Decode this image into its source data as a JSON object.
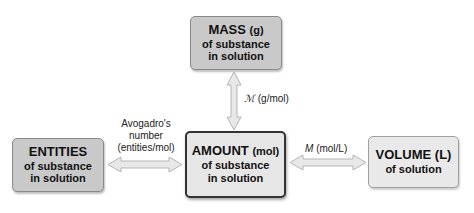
{
  "boxes": {
    "mass": {
      "title": "MASS",
      "unit": "(g)",
      "line1": "of substance",
      "line2": "in solution"
    },
    "entities": {
      "title": "ENTITIES",
      "line1": "of substance",
      "line2": "in solution"
    },
    "amount": {
      "title": "AMOUNT",
      "unit": "(mol)",
      "line1": "of substance",
      "line2": "in solution"
    },
    "volume": {
      "title": "VOLUME",
      "unit": "(L)",
      "line1": "of solution"
    }
  },
  "conversions": {
    "molar_mass": {
      "symbol": "ℳ",
      "unit": "(g/mol)"
    },
    "avogadro": {
      "line1": "Avogadro's",
      "line2": "number",
      "line3": "(entities/mol)"
    },
    "molarity": {
      "symbol": "M",
      "unit": "(mol/L)"
    }
  },
  "colors": {
    "box_dark": "#c9c9c9",
    "box_light": "#e6e6e6",
    "arrow_fill": "#e8e8e8",
    "arrow_stroke": "#b5b5b5"
  }
}
